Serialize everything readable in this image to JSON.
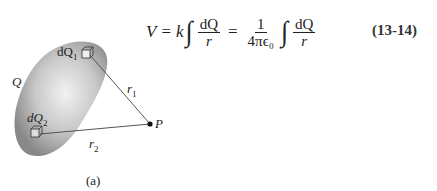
{
  "equation": {
    "lhs": "V",
    "equals": "=",
    "constant": "k",
    "integral": "∫",
    "numerator": "dQ",
    "denominator": "r",
    "coef_numerator": "1",
    "coef_denominator": "4πϵ₀",
    "number": "(13-14)"
  },
  "figure": {
    "labels": {
      "charge": "Q",
      "dq1": "dQ",
      "dq1_sub": "1",
      "dq2": "dQ",
      "dq2_sub": "2",
      "r1": "r",
      "r1_sub": "1",
      "r2": "r",
      "r2_sub": "2",
      "point": "P"
    },
    "caption": "(a)"
  }
}
